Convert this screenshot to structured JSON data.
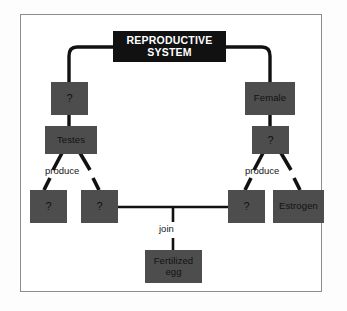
{
  "diagram": {
    "type": "concept-map",
    "title": "REPRODUCTIVE SYSTEM",
    "nodes": {
      "root": {
        "label": "REPRODUCTIVE SYSTEM"
      },
      "male": {
        "label": "?"
      },
      "testes": {
        "label": "Testes"
      },
      "female": {
        "label": "Female"
      },
      "ovaries": {
        "label": "?"
      },
      "sperm": {
        "label": "?"
      },
      "testosterone": {
        "label": "?"
      },
      "egg": {
        "label": "?"
      },
      "estrogen": {
        "label": "Estrogen"
      },
      "fertilized_egg": {
        "label": "Fertilized egg"
      }
    },
    "link_labels": {
      "produce_left": "produce",
      "produce_right": "produce",
      "join": "join"
    },
    "colors": {
      "title_box": "#111111",
      "title_text": "#ffffff",
      "node_box": "#4d4d4d",
      "node_text": "#111111",
      "connector": "#111111",
      "frame_border": "#8d8d8d",
      "canvas_background": "#ffffff"
    }
  }
}
